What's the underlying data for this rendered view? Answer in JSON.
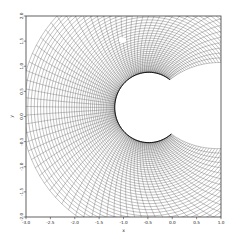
{
  "figure": {
    "background_color": "#ffffff",
    "width": 237,
    "height": 249
  },
  "plot_box": {
    "left": 26,
    "top": 16,
    "right": 221,
    "bottom": 217,
    "border_color": "#3a3a3a"
  },
  "axis_titles": {
    "x": "x",
    "y": "y"
  },
  "chart_data": {
    "type": "line",
    "title": "",
    "subtitle": "",
    "xlabel": "x",
    "ylabel": "y",
    "xlim": [
      -3.0,
      1.0
    ],
    "ylim": [
      -2.0,
      2.0
    ],
    "grid": false,
    "legend_position": "none",
    "xticks": [
      -3.0,
      -2.5,
      -2.0,
      -1.5,
      -1.0,
      -0.5,
      0.0,
      0.5,
      1.0
    ],
    "xtick_labels": [
      "-3.0",
      "-2.5",
      "-2.0",
      "-1.5",
      "-1.0",
      "-0.5",
      "0.0",
      "0.5",
      "1.0"
    ],
    "yticks": [
      -2.0,
      -1.5,
      -1.0,
      -0.5,
      0.0,
      0.5,
      1.0,
      1.5,
      2.0
    ],
    "ytick_labels": [
      "-2.0",
      "-1.5",
      "-1.0",
      "-0.5",
      "0.0",
      "0.5",
      "1.0",
      "1.5",
      "2.0"
    ],
    "mesh": {
      "center_x": -0.48,
      "center_y": 0.18,
      "inner_radius": 0.7,
      "outer_radius": 2.62,
      "theta_start_deg": 52,
      "theta_end_deg": 311,
      "n_radial": 44,
      "n_circumferential": 86,
      "radial_stretch": 1.55,
      "shear_factor": 0.3,
      "line_color": "#141414",
      "inner_boundary_color": "#000000"
    },
    "notch": {
      "cx": -1.02,
      "cy": 1.52,
      "rx": 0.075,
      "ry": 0.055
    },
    "series": [
      {
        "name": "mesh-circumferential-lines",
        "count": 44
      },
      {
        "name": "mesh-radial-lines",
        "count": 86
      }
    ]
  }
}
